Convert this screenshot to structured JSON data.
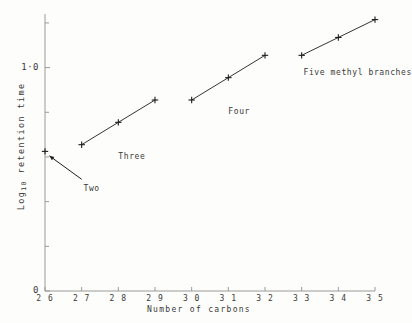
{
  "chart_data": {
    "type": "line",
    "title": "",
    "xlabel": "Number of carbons",
    "ylabel": "Log10 retention time",
    "ylabel_base": "Log",
    "ylabel_sub": "10",
    "ylabel_rest": " retention time",
    "xlim": [
      26,
      35
    ],
    "ylim": [
      0,
      1.24
    ],
    "grid": false,
    "legend_position": "inline-annotations",
    "xticks": [
      26,
      27,
      28,
      29,
      30,
      31,
      32,
      33,
      34,
      35
    ],
    "xtick_labels": [
      "2 6",
      "2 7",
      "2 8",
      "2 9",
      "3 0",
      "3 1",
      "3 2",
      "3 3",
      "3 4",
      "3 5"
    ],
    "yticks_major": [
      0,
      1.0
    ],
    "ytick_labels": [
      "0",
      "1·0"
    ],
    "yticks_minor": [
      0.2,
      0.4,
      0.6,
      0.8,
      1.2
    ],
    "marker": "plus",
    "line_color": "#1d1d1d",
    "axis_color": "#9a9a9a",
    "series": [
      {
        "name": "Two",
        "label": "Two",
        "points": [
          [
            26.0,
            0.625
          ]
        ],
        "label_x": 27.05,
        "label_y": 0.455,
        "annotation_arrow": true,
        "arrow_from": [
          27.0,
          0.5
        ],
        "arrow_to": [
          26.12,
          0.605
        ]
      },
      {
        "name": "Three",
        "label": "Three",
        "points": [
          [
            27.0,
            0.655
          ],
          [
            28.0,
            0.755
          ],
          [
            29.0,
            0.855
          ]
        ],
        "label_x": 28.0,
        "label_y": 0.6
      },
      {
        "name": "Four",
        "label": "Four",
        "points": [
          [
            30.0,
            0.855
          ],
          [
            31.0,
            0.955
          ],
          [
            32.0,
            1.055
          ]
        ],
        "label_x": 31.0,
        "label_y": 0.8
      },
      {
        "name": "Five methyl branches",
        "label": "Five methyl branches",
        "points": [
          [
            33.0,
            1.055
          ],
          [
            34.0,
            1.135
          ],
          [
            35.0,
            1.215
          ]
        ],
        "label_x": 33.05,
        "label_y": 0.975
      }
    ]
  }
}
